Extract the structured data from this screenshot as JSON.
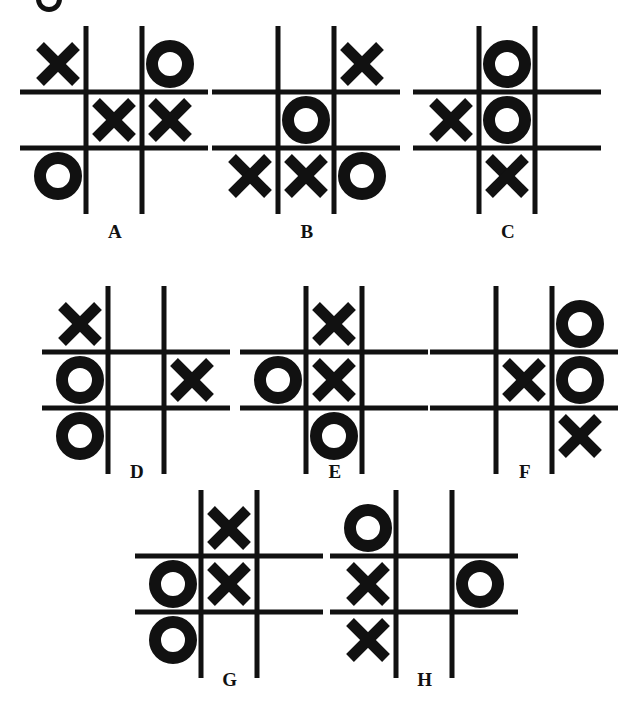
{
  "figure": {
    "kind": "tic-tac-toe-board-set",
    "board_count": 8,
    "mark_x": "X",
    "mark_o": "O",
    "empty": "",
    "ink_color": "#111111",
    "background_color": "#ffffff",
    "grid_line_width": 5,
    "cell_size": 56
  },
  "top_fragment": {
    "description": "cropped glyph fragment",
    "visible": true
  },
  "boards": [
    {
      "label": "A",
      "x": 30,
      "y": 36,
      "label_x": 30,
      "label_y": 222,
      "label_width": 170,
      "cells": [
        "X",
        "",
        "O",
        "",
        "X",
        "X",
        "O",
        "",
        ""
      ]
    },
    {
      "label": "B",
      "x": 222,
      "y": 36,
      "label_x": 222,
      "label_y": 222,
      "label_width": 170,
      "cells": [
        "",
        "",
        "X",
        "",
        "O",
        "",
        "X",
        "X",
        "O"
      ]
    },
    {
      "label": "C",
      "x": 423,
      "y": 36,
      "label_x": 423,
      "label_y": 222,
      "label_width": 170,
      "cells": [
        "",
        "O",
        "",
        "X",
        "O",
        "",
        "",
        "X",
        ""
      ]
    },
    {
      "label": "D",
      "x": 52,
      "y": 296,
      "label_x": 52,
      "label_y": 462,
      "label_width": 170,
      "cells": [
        "X",
        "",
        "",
        "O",
        "",
        "X",
        "O",
        "",
        ""
      ]
    },
    {
      "label": "E",
      "x": 250,
      "y": 296,
      "label_x": 250,
      "label_y": 462,
      "label_width": 170,
      "cells": [
        "",
        "X",
        "",
        "O",
        "X",
        "",
        "",
        "O",
        ""
      ]
    },
    {
      "label": "F",
      "x": 440,
      "y": 296,
      "label_x": 440,
      "label_y": 462,
      "label_width": 170,
      "cells": [
        "",
        "",
        "O",
        "",
        "X",
        "O",
        "",
        "",
        "X"
      ]
    },
    {
      "label": "G",
      "x": 145,
      "y": 500,
      "label_x": 145,
      "label_y": 670,
      "label_width": 170,
      "cells": [
        "",
        "X",
        "",
        "O",
        "X",
        "",
        "O",
        "",
        ""
      ]
    },
    {
      "label": "H",
      "x": 340,
      "y": 500,
      "label_x": 340,
      "label_y": 670,
      "label_width": 170,
      "cells": [
        "O",
        "",
        "",
        "X",
        "",
        "O",
        "X",
        "",
        ""
      ]
    }
  ]
}
